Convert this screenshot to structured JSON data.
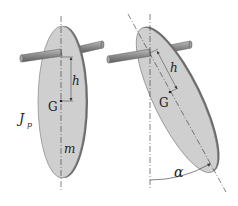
{
  "diagram": {
    "left": {
      "label_h": "h",
      "label_G": "G",
      "label_J": "J",
      "label_J_sub": "p",
      "label_m": "m"
    },
    "right": {
      "label_h": "h",
      "label_G": "G",
      "label_alpha": "α"
    },
    "colors": {
      "disk_fill": "#cfcfcf",
      "disk_edge": "#6b6b6b",
      "axle": "#8a8a8a",
      "line": "#333333"
    }
  }
}
